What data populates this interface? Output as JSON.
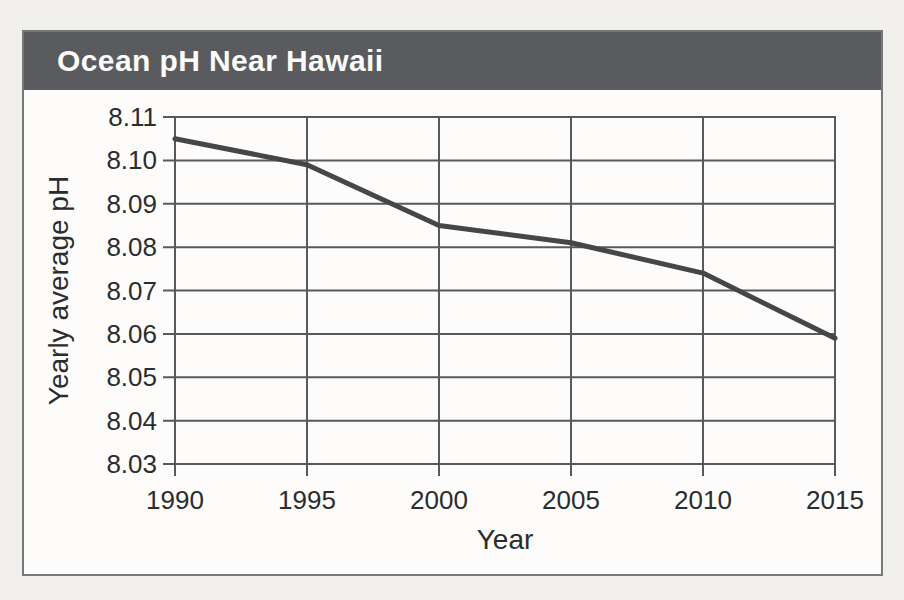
{
  "figure": {
    "title": "Ocean pH Near Hawaii",
    "colors": {
      "band": "#5a5b5e",
      "panel": "#fdfcfa",
      "paper": "#f1f0ec",
      "grid": "#58595b",
      "line": "#454648",
      "text": "#2b2c2e",
      "title_text": "#fbfbfb",
      "border": "#77787b"
    }
  },
  "chart_data": {
    "type": "line",
    "title": "Ocean pH Near Hawaii",
    "xlabel": "Year",
    "ylabel": "Yearly average pH",
    "x": [
      1990,
      1995,
      2000,
      2005,
      2010,
      2015
    ],
    "y": [
      8.105,
      8.099,
      8.085,
      8.081,
      8.074,
      8.059
    ],
    "series": [
      {
        "name": "Yearly average pH near Hawaii",
        "x": [
          1990,
          1995,
          2000,
          2005,
          2010,
          2015
        ],
        "values": [
          8.105,
          8.099,
          8.085,
          8.081,
          8.074,
          8.059
        ]
      }
    ],
    "xlim": [
      1990,
      2015
    ],
    "ylim": [
      8.03,
      8.11
    ],
    "xtick_step": 5,
    "ytick_step": 0.01,
    "ytick_decimals": 2,
    "grid": true,
    "legend": false
  }
}
